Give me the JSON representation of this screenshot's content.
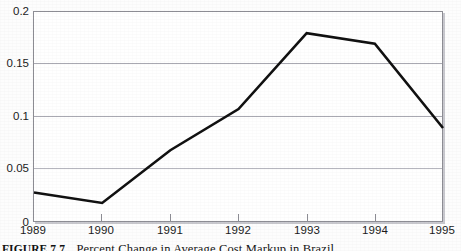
{
  "figure": {
    "caption_id": "FIGURE 7.7",
    "caption_text": "Percent Change in Average Cost Markup in Brazil"
  },
  "colors": {
    "line": "#111111",
    "grid": "#a9a9b2",
    "frame": "#8d8d94",
    "background": "#ffffff",
    "shadow": "#c9c9cf"
  },
  "chart_data": {
    "type": "line",
    "title": "",
    "subtitle": "",
    "xlabel": "",
    "ylabel": "",
    "categories": [
      "1989",
      "1990",
      "1991",
      "1992",
      "1993",
      "1994",
      "1995"
    ],
    "x": [
      1989,
      1990,
      1991,
      1992,
      1993,
      1994,
      1995
    ],
    "values": [
      0.029,
      0.019,
      0.069,
      0.108,
      0.18,
      0.17,
      0.09
    ],
    "series": [
      {
        "name": "Average cost markup",
        "values": [
          0.029,
          0.019,
          0.069,
          0.108,
          0.18,
          0.17,
          0.09
        ]
      }
    ],
    "ylim": [
      0,
      0.2
    ],
    "xlim": [
      1989,
      1995
    ],
    "yticks": [
      0,
      0.05,
      0.1,
      0.15,
      0.2
    ],
    "ytick_labels": [
      "0",
      "0.05",
      "0.1",
      "0.15",
      "0.2"
    ],
    "xticks": [
      1989,
      1990,
      1991,
      1992,
      1993,
      1994,
      1995
    ],
    "xtick_labels": [
      "1989",
      "1990",
      "1991",
      "1992",
      "1993",
      "1994",
      "1995"
    ],
    "grid": true,
    "grid_axis": "y",
    "legend": false,
    "legend_position": "none",
    "markers": false,
    "line_width": 2.6,
    "annotations": []
  }
}
